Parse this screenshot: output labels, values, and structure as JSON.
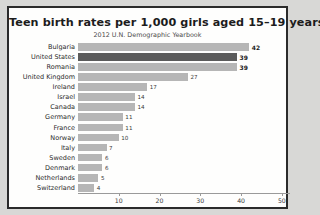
{
  "chart_data": {
    "type": "bar",
    "orientation": "horizontal",
    "title": "Teen birth rates per 1,000 girls aged 15–19 years",
    "subtitle": "2012  U.N. Demographic Yearbook",
    "xlabel": "",
    "ylabel": "",
    "xlim": [
      0,
      52
    ],
    "grid": false,
    "legend": false,
    "highlight_category": "United States",
    "highlight_color": "#5b5b5b",
    "bar_color": "#b6b6b6",
    "xticks": [
      10,
      20,
      30,
      40,
      50
    ],
    "xtick_labels": [
      "10",
      "20",
      "30",
      "40",
      "50"
    ],
    "categories": [
      "Bulgaria",
      "United States",
      "Romania",
      "United Kingdom",
      "Ireland",
      "Israel",
      "Canada",
      "Germany",
      "France",
      "Norway",
      "Italy",
      "Sweden",
      "Denmark",
      "Netherlands",
      "Switzerland"
    ],
    "values": [
      42,
      39,
      39,
      27,
      17,
      14,
      14,
      11,
      11,
      10,
      7,
      6,
      6,
      5,
      4
    ],
    "value_labels": [
      "42",
      "39",
      "39",
      "27",
      "17",
      "14",
      "14",
      "11",
      "11",
      "10",
      "7",
      "6",
      "6",
      "5",
      "4"
    ]
  }
}
